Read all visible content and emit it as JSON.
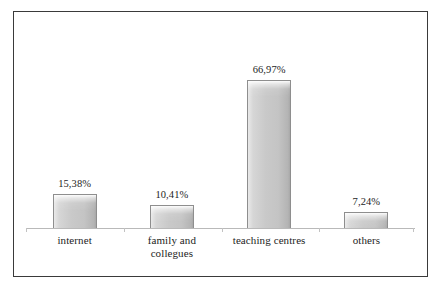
{
  "chart_data": {
    "type": "bar",
    "title": "",
    "subtitle": "",
    "xlabel": "",
    "ylabel": "",
    "ylim": [
      0,
      75
    ],
    "grid": false,
    "legend": null,
    "value_suffix": "%",
    "decimal_separator": ",",
    "categories": [
      "internet",
      "family and collegues",
      "teaching centres",
      "others"
    ],
    "values": [
      15.38,
      10.41,
      66.97,
      7.24
    ],
    "value_labels": [
      "15,38%",
      "10,41%",
      "66,97%",
      "7,24%"
    ],
    "bars": [
      {
        "category": "internet",
        "label_lines": [
          "internet"
        ],
        "value": 15.38,
        "value_label": "15,38%"
      },
      {
        "category": "family and collegues",
        "label_lines": [
          "family and",
          "collegues"
        ],
        "value": 10.41,
        "value_label": "10,41%"
      },
      {
        "category": "teaching centres",
        "label_lines": [
          "teaching centres"
        ],
        "value": 66.97,
        "value_label": "66,97%"
      },
      {
        "category": "others",
        "label_lines": [
          "others"
        ],
        "value": 7.24,
        "value_label": "7,24%"
      }
    ],
    "colors": {
      "bar_fill_light": "#e9e9e9",
      "bar_fill_mid": "#c9c9c9",
      "bar_fill_dark": "#a8a8a8",
      "bar_border": "#8e8e8e",
      "axis_line": "#b9b9b9",
      "frame_border": "#3a3a3a",
      "background": "#ffffff",
      "text": "#1d1d1d"
    }
  }
}
